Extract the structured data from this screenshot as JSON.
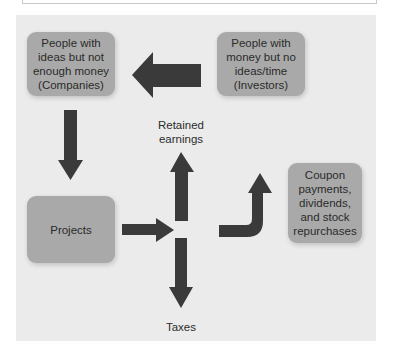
{
  "diagram": {
    "title": "",
    "nodes": {
      "companies": {
        "label": "People with\nideas but not\nenough money\n(Companies)"
      },
      "investors": {
        "label": "People with\nmoney but no\nideas/time\n(Investors)"
      },
      "projects": {
        "label": "Projects"
      },
      "payouts": {
        "label": "Coupon\npayments,\ndividends,\nand stock\nrepurchases"
      },
      "retained_earnings": {
        "label": "Retained\nearnings"
      },
      "taxes": {
        "label": "Taxes"
      }
    },
    "edges": [
      {
        "from": "investors",
        "to": "companies",
        "shape": "straight-arrow-left"
      },
      {
        "from": "companies",
        "to": "projects",
        "shape": "straight-arrow-down"
      },
      {
        "from": "projects",
        "to": "junction",
        "shape": "straight-arrow-right"
      },
      {
        "from": "junction",
        "to": "retained_earnings",
        "shape": "straight-arrow-up"
      },
      {
        "from": "junction",
        "to": "taxes",
        "shape": "straight-arrow-down"
      },
      {
        "from": "junction",
        "to": "payouts",
        "shape": "curved-arrow-up"
      }
    ],
    "colors": {
      "panel_background": "#ebebeb",
      "box_fill": "#a9a9a9",
      "arrow_fill": "#3a3a3a",
      "text": "#2b2b2b"
    }
  }
}
